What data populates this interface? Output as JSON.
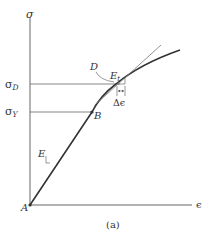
{
  "figure": {
    "caption": "(a)",
    "axes": {
      "y_label": "σ",
      "x_label": "ϵ"
    },
    "levels": {
      "sigma_D": {
        "base": "σ",
        "sub": "D"
      },
      "sigma_Y": {
        "base": "σ",
        "sub": "Y"
      }
    },
    "points": {
      "A": "A",
      "B": "B",
      "D": "D"
    },
    "annotations": {
      "tangent_modulus": {
        "base": "E",
        "sub": "t"
      },
      "elastic_modulus": "E",
      "strain_increment": "Δϵ"
    },
    "colors": {
      "line": "#333333",
      "axis": "#555555",
      "tangent": "#777777"
    }
  }
}
